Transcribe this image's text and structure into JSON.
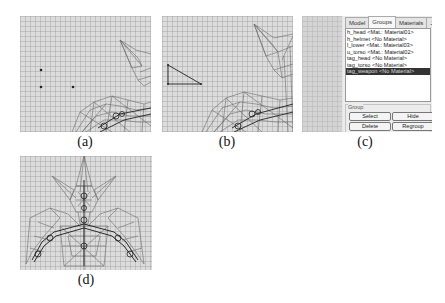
{
  "figure": {
    "panels": [
      {
        "id": "a",
        "caption": "(a)",
        "description": "wireframe viewport with three placed vertices"
      },
      {
        "id": "b",
        "caption": "(b)",
        "description": "wireframe viewport with new triangle face"
      },
      {
        "id": "c",
        "caption": "(c)",
        "description": "group list panel"
      },
      {
        "id": "d",
        "caption": "(d)",
        "description": "wireframe model front view"
      }
    ]
  },
  "panel_a": {
    "vertices": [
      [
        21,
        54
      ],
      [
        21,
        71
      ],
      [
        53,
        71
      ]
    ]
  },
  "panel_b": {
    "triangle": [
      [
        6,
        49
      ],
      [
        6,
        68
      ],
      [
        39,
        68
      ]
    ]
  },
  "panel_c": {
    "tabs": [
      {
        "label": "Model",
        "active": false
      },
      {
        "label": "Groups",
        "active": true
      },
      {
        "label": "Materials",
        "active": false
      },
      {
        "label": "Joints",
        "active": false
      }
    ],
    "groups": [
      {
        "label": "h_head <Mat.: Material01>",
        "selected": false
      },
      {
        "label": "h_helmet <No Material>",
        "selected": false
      },
      {
        "label": "l_lower <Mat.: Material03>",
        "selected": false
      },
      {
        "label": "u_torso <Mat.: Material02>",
        "selected": false
      },
      {
        "label": "tag_head <No Material>",
        "selected": false
      },
      {
        "label": "tag_torso <No Material>",
        "selected": false
      },
      {
        "label": "tag_weapon <No Material>",
        "selected": true
      }
    ],
    "group_box_label": "Group",
    "buttons": {
      "select": "Select",
      "hide": "Hide",
      "delete": "Delete",
      "regroup": "Regroup"
    }
  },
  "colors": {
    "viewport_bg": "#dcdcdc",
    "wire": "#555555",
    "selection_bg": "#333333"
  }
}
